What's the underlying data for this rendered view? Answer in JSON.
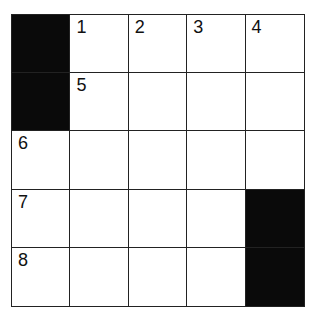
{
  "puzzle": {
    "rows": 5,
    "cols": 5,
    "colors": {
      "block": "#0a0a0a",
      "cell": "#ffffff",
      "line": "#222222",
      "number": "#111111"
    },
    "cells": [
      [
        {
          "block": true,
          "num": null
        },
        {
          "block": false,
          "num": "1"
        },
        {
          "block": false,
          "num": "2"
        },
        {
          "block": false,
          "num": "3"
        },
        {
          "block": false,
          "num": "4"
        }
      ],
      [
        {
          "block": true,
          "num": null
        },
        {
          "block": false,
          "num": "5"
        },
        {
          "block": false,
          "num": null
        },
        {
          "block": false,
          "num": null
        },
        {
          "block": false,
          "num": null
        }
      ],
      [
        {
          "block": false,
          "num": "6"
        },
        {
          "block": false,
          "num": null
        },
        {
          "block": false,
          "num": null
        },
        {
          "block": false,
          "num": null
        },
        {
          "block": false,
          "num": null
        }
      ],
      [
        {
          "block": false,
          "num": "7"
        },
        {
          "block": false,
          "num": null
        },
        {
          "block": false,
          "num": null
        },
        {
          "block": false,
          "num": null
        },
        {
          "block": true,
          "num": null
        }
      ],
      [
        {
          "block": false,
          "num": "8"
        },
        {
          "block": false,
          "num": null
        },
        {
          "block": false,
          "num": null
        },
        {
          "block": false,
          "num": null
        },
        {
          "block": true,
          "num": null
        }
      ]
    ]
  }
}
